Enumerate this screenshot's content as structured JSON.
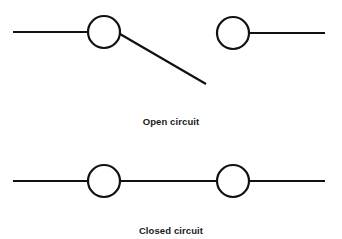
{
  "colors": {
    "stroke": "#111111",
    "background": "#ffffff",
    "text": "#1a1a1a"
  },
  "diagrams": [
    {
      "id": "open-circuit",
      "label": "Open circuit",
      "state": "open",
      "elements": {
        "left_wire": {
          "x1": 13,
          "y1": 32,
          "x2": 88,
          "y2": 32
        },
        "left_terminal": {
          "cx": 104,
          "cy": 32,
          "r": 16
        },
        "switch_arm": {
          "x1": 120,
          "y1": 34,
          "x2": 206,
          "y2": 84
        },
        "right_terminal": {
          "cx": 233,
          "cy": 33,
          "r": 16
        },
        "right_wire": {
          "x1": 249,
          "y1": 33,
          "x2": 325,
          "y2": 33
        }
      }
    },
    {
      "id": "closed-circuit",
      "label": "Closed circuit",
      "state": "closed",
      "elements": {
        "left_wire": {
          "x1": 13,
          "y1": 181,
          "x2": 88,
          "y2": 181
        },
        "left_terminal": {
          "cx": 104,
          "cy": 181,
          "r": 16
        },
        "bridge_wire": {
          "x1": 120,
          "y1": 181,
          "x2": 217,
          "y2": 181
        },
        "right_terminal": {
          "cx": 233,
          "cy": 181,
          "r": 16
        },
        "right_wire": {
          "x1": 249,
          "y1": 181,
          "x2": 325,
          "y2": 181
        }
      }
    }
  ]
}
